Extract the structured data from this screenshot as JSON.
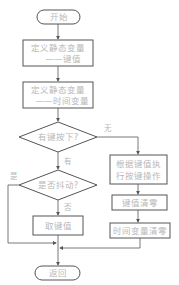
{
  "flowchart": {
    "start": {
      "label": "开始"
    },
    "define_key": {
      "line1": "定义静态变量",
      "line2": "——键值"
    },
    "define_time": {
      "line1": "定义静态变量",
      "line2": "——时间变量"
    },
    "decision_key_pressed": {
      "label": "有键按下?",
      "yes": "有",
      "no": "无"
    },
    "decision_jitter": {
      "label": "是否抖动?",
      "yes": "是",
      "no": "否"
    },
    "get_key": {
      "label": "取键值"
    },
    "execute_action": {
      "line1": "根据键值执",
      "line2": "行按键操作"
    },
    "clear_key": {
      "label": "键值清零"
    },
    "clear_time": {
      "label": "时间变量清零"
    },
    "end": {
      "label": "返回"
    }
  },
  "colors": {
    "stroke": "#555555",
    "text": "#b8b8b8",
    "background": "#ffffff"
  }
}
